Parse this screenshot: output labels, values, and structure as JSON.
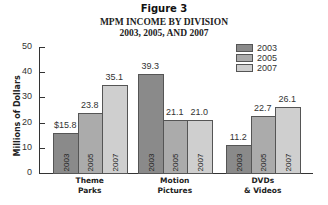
{
  "figure_label": "Figure 3",
  "title_line1": "MPM INCOME BY DIVISION",
  "title_line2": "2003, 2005, AND 2007",
  "colors": {
    "2003": "#8a8a8a",
    "2005": "#ababab",
    "2007": "#cfcfcf"
  },
  "chart_data": {
    "type": "bar",
    "title": "MPM INCOME BY DIVISION 2003, 2005, AND 2007",
    "xlabel": "",
    "ylabel": "Millions of Dollars",
    "ylim": [
      0,
      50
    ],
    "yticks": [
      "0",
      "10",
      "20",
      "30",
      "40",
      "50"
    ],
    "grid": false,
    "legend_position": "top-right",
    "categories": [
      "Theme Parks",
      "Motion Pictures",
      "DVDs & Videos"
    ],
    "series": [
      {
        "name": "2003",
        "values": [
          15.8,
          39.3,
          11.2
        ],
        "labels": [
          "$15.8",
          "39.3",
          "11.2"
        ]
      },
      {
        "name": "2005",
        "values": [
          23.8,
          21.1,
          22.7
        ],
        "labels": [
          "23.8",
          "21.1",
          "22.7"
        ]
      },
      {
        "name": "2007",
        "values": [
          35.1,
          21.0,
          26.1
        ],
        "labels": [
          "35.1",
          "21.0",
          "26.1"
        ]
      }
    ]
  },
  "categories_display": [
    {
      "line1": "Theme",
      "line2": "Parks"
    },
    {
      "line1": "Motion",
      "line2": "Pictures"
    },
    {
      "line1": "DVDs",
      "line2": "& Videos"
    }
  ],
  "legend": [
    "2003",
    "2005",
    "2007"
  ]
}
